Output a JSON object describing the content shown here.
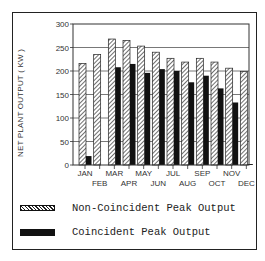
{
  "chart_data": {
    "type": "bar",
    "title": "",
    "xlabel": "",
    "ylabel": "NET PLANT OUTPUT ( KW )",
    "ylim": [
      0,
      300
    ],
    "yticks": [
      0,
      50,
      100,
      150,
      200,
      250,
      300
    ],
    "grid": true,
    "legend_position": "bottom",
    "categories": [
      "JAN",
      "FEB",
      "MAR",
      "APR",
      "MAY",
      "JUN",
      "JUL",
      "AUG",
      "SEP",
      "OCT",
      "NOV",
      "DEC"
    ],
    "series": [
      {
        "name": "Non-Coincident Peak Output",
        "pattern": "hatched",
        "values": [
          216,
          235,
          268,
          265,
          253,
          240,
          227,
          219,
          227,
          219,
          206,
          199
        ]
      },
      {
        "name": "Coincident Peak Output",
        "pattern": "solid",
        "values": [
          19,
          0,
          208,
          215,
          196,
          204,
          200,
          176,
          190,
          163,
          133,
          2
        ]
      }
    ]
  },
  "legend": {
    "items": [
      {
        "label": "Non-Coincident Peak Output"
      },
      {
        "label": "Coincident Peak Output"
      }
    ]
  },
  "colors": {
    "ink": "#111111",
    "background": "#ffffff"
  }
}
